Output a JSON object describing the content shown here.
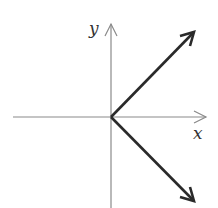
{
  "diagram": {
    "type": "vector-diagram",
    "axes": {
      "x_label": "x",
      "y_label": "y",
      "axis_color": "#8a8a8a"
    },
    "vectors": [
      {
        "name": "upper-vector",
        "direction": "up-right",
        "angle_deg": 45,
        "color": "#2a2a2a"
      },
      {
        "name": "lower-vector",
        "direction": "down-right",
        "angle_deg": -45,
        "color": "#2a2a2a"
      }
    ]
  }
}
